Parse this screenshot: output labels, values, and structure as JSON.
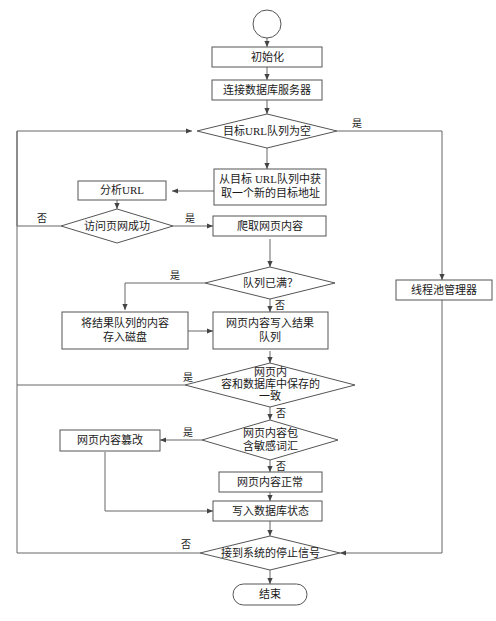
{
  "diagram": {
    "type": "flowchart",
    "language": "zh-CN",
    "colors": {
      "background": "#ffffff",
      "shape_stroke": "#555555",
      "shape_fill": "#ffffff",
      "connector": "#666666",
      "text": "#1a1a1a"
    },
    "nodes": {
      "start": {
        "label": "",
        "shape": "circle"
      },
      "init": {
        "label": "初始化",
        "shape": "process"
      },
      "connect_db": {
        "label": "连接数据库服务器",
        "shape": "process"
      },
      "url_queue_empty": {
        "label": "目标URL队列为空",
        "shape": "decision"
      },
      "get_new_url": {
        "line1": "从目标 URL队列中获",
        "line2": "取一个新的目标地址",
        "shape": "process"
      },
      "parse_url": {
        "label": "分析URL",
        "shape": "process"
      },
      "visit_ok": {
        "label": "访问页网成功",
        "shape": "decision"
      },
      "crawl_page": {
        "label": "爬取网页内容",
        "shape": "process"
      },
      "queue_full": {
        "label": "队列已满？",
        "shape": "decision"
      },
      "save_to_disk": {
        "line1": "将结果队列的内容",
        "line2": "存入磁盘",
        "shape": "process"
      },
      "write_result_queue": {
        "line1": "网页内容写入结果",
        "line2": "队列",
        "shape": "process"
      },
      "content_match_db": {
        "line1": "网页内",
        "line2": "容和数据库中保存的",
        "line3": "一致",
        "shape": "decision"
      },
      "has_sensitive_words": {
        "line1": "网页内容包",
        "line2": "含敏感词汇",
        "shape": "decision"
      },
      "content_tampered": {
        "label": "网页内容篡改",
        "shape": "process"
      },
      "content_normal": {
        "label": "网页内容正常",
        "shape": "process"
      },
      "write_db_status": {
        "label": "写入数据库状态",
        "shape": "process"
      },
      "stop_signal": {
        "label": "接到系统的停止信号",
        "shape": "decision"
      },
      "end": {
        "label": "结束",
        "shape": "terminator"
      },
      "thread_pool_manager": {
        "label": "线程池管理器",
        "shape": "process"
      }
    },
    "edge_labels": {
      "url_queue_empty_yes": "是",
      "visit_ok_no": "否",
      "visit_ok_yes": "是",
      "queue_full_yes": "是",
      "queue_full_no": "否",
      "content_match_db_yes": "是",
      "content_match_db_no": "否",
      "has_sensitive_words_yes": "是",
      "has_sensitive_words_no": "否",
      "stop_signal_no": "否"
    }
  }
}
